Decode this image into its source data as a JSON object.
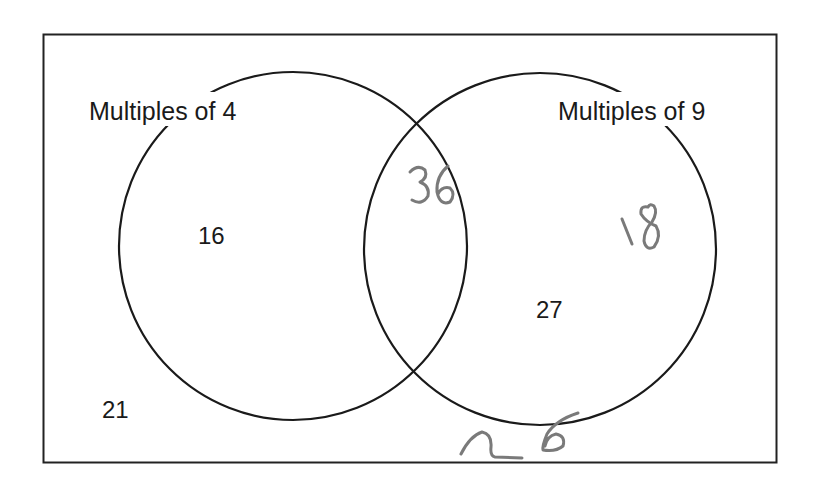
{
  "diagram": {
    "type": "venn",
    "universal_set_box": true,
    "sets": [
      {
        "id": "A",
        "label": "Multiples of 4"
      },
      {
        "id": "B",
        "label": "Multiples of 9"
      }
    ],
    "regions": {
      "A_only": [
        "16"
      ],
      "A_and_B": [
        "36"
      ],
      "B_only": [
        "27",
        "18"
      ],
      "outside": [
        "21",
        "26"
      ]
    },
    "printed_numbers": {
      "a_only": "16",
      "b_only": "27",
      "outside": "21"
    },
    "handwritten_numbers": {
      "intersection": "36",
      "b_only": "18",
      "outside": "26"
    },
    "colors": {
      "printed": "#1a1a1a",
      "handwriting": "#7a7a7a",
      "background": "#ffffff"
    }
  }
}
